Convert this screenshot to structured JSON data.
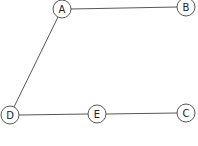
{
  "diagram": {
    "type": "graph",
    "nodes": [
      {
        "id": "A",
        "label": "A",
        "x": 62,
        "y": 9,
        "r": 9
      },
      {
        "id": "B",
        "label": "B",
        "x": 186,
        "y": 7,
        "r": 9
      },
      {
        "id": "C",
        "label": "C",
        "x": 186,
        "y": 113,
        "r": 9
      },
      {
        "id": "D",
        "label": "D",
        "x": 10,
        "y": 115,
        "r": 9
      },
      {
        "id": "E",
        "label": "E",
        "x": 97,
        "y": 114,
        "r": 9
      }
    ],
    "edges": [
      {
        "from": "A",
        "to": "B"
      },
      {
        "from": "A",
        "to": "D"
      },
      {
        "from": "D",
        "to": "E"
      },
      {
        "from": "E",
        "to": "C"
      }
    ]
  }
}
